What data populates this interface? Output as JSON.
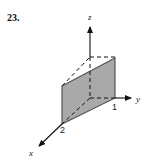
{
  "problem": {
    "number": "23."
  },
  "axes": {
    "x_label": "x",
    "y_label": "y",
    "z_label": "z"
  },
  "tick_labels": {
    "x_intercept": "2",
    "y_intercept": "1"
  },
  "colors": {
    "panel_fill": "#a9a9a9",
    "panel_edge": "#555555",
    "axis": "#111111"
  }
}
